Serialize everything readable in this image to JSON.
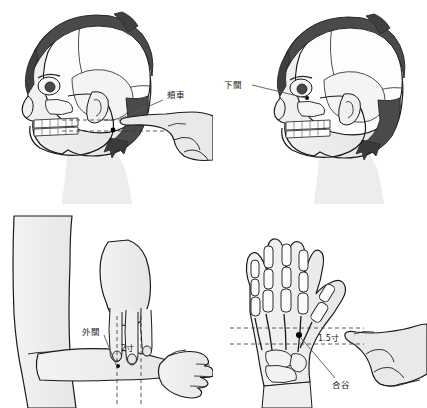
{
  "figure": {
    "background_color": "#ffffff",
    "panel_count": 4
  },
  "colors": {
    "background": "#ffffff",
    "outline": "#1a1a1a",
    "hair_dark": "#4a4a4a",
    "hair_darker": "#3a3a3a",
    "skin_shade": "#ededed",
    "skin_shade2": "#e2e2e2",
    "bone_fill": "#fbfbfb",
    "bone_shade": "#e8e8e8",
    "point_dot": "#000000",
    "guide_line": "#333333",
    "leader_line": "#555555",
    "text": "#1a1a1a"
  },
  "panels": [
    {
      "id": "jiache",
      "position": "top-left",
      "subject": "head-lateral-skull-overlay",
      "label": "頰車",
      "label_x": 167,
      "label_y": 98,
      "leader_from_x": 163,
      "leader_from_y": 100,
      "leader_to_x": 120,
      "leader_to_y": 119,
      "measure_label": "",
      "guide_lines": 2,
      "has_pointing_hand": true,
      "hand_side": "right",
      "point_dot_x": 113,
      "point_dot_y": 130
    },
    {
      "id": "xiaguan",
      "position": "top-right",
      "subject": "head-lateral-skull-overlay",
      "label": "下關",
      "label_x": 12,
      "label_y": 85,
      "leader_from_x": 38,
      "leader_from_y": 85,
      "leader_to_x": 92,
      "leader_to_y": 98,
      "measure_label": "",
      "guide_lines": 0,
      "has_pointing_hand": false,
      "hand_side": "",
      "point_dot_x": 93,
      "point_dot_y": 98
    },
    {
      "id": "waiguan",
      "position": "bottom-left",
      "subject": "forearm-with-three-finger-measure",
      "label": "外關",
      "label_x": 85,
      "label_y": 128,
      "leader_from_x": 104,
      "leader_from_y": 131,
      "leader_to_x": 117,
      "leader_to_y": 162,
      "measure_label": "2寸",
      "measure_label_x": 122,
      "measure_label_y": 145,
      "guide_lines": 2,
      "has_pointing_hand": false,
      "hand_side": "",
      "point_dot_x": 118,
      "point_dot_y": 162
    },
    {
      "id": "hegu",
      "position": "bottom-right",
      "subject": "hand-dorsum-skeleton",
      "label": "合谷",
      "label_x": 122,
      "label_y": 182,
      "leader_from_x": 121,
      "leader_from_y": 175,
      "leader_to_x": 87,
      "leader_to_y": 133,
      "measure_label": "1.5寸",
      "measure_label_x": 106,
      "measure_label_y": 136,
      "guide_lines": 2,
      "has_pointing_hand": true,
      "hand_side": "right",
      "point_dot_x": 85,
      "point_dot_y": 131
    }
  ],
  "acupoints": [
    {
      "name": "頰車",
      "romanization": "Jiache",
      "panel": "jiache"
    },
    {
      "name": "下關",
      "romanization": "Xiaguan",
      "panel": "xiaguan"
    },
    {
      "name": "外關",
      "romanization": "Waiguan",
      "panel": "waiguan",
      "measure": "2寸"
    },
    {
      "name": "合谷",
      "romanization": "Hegu",
      "panel": "hegu",
      "measure": "1.5寸"
    }
  ]
}
